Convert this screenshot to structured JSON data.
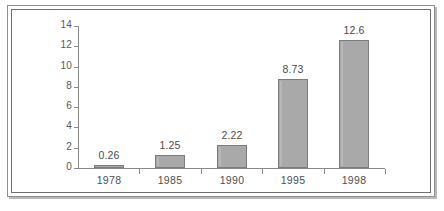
{
  "figure": {
    "border_color": "#8e8e8e",
    "background": "#ffffff"
  },
  "chart_data": {
    "type": "bar",
    "title": "",
    "subtitle": "",
    "xlabel": "",
    "ylabel": "",
    "categories": [
      "1978",
      "1985",
      "1990",
      "1995",
      "1998"
    ],
    "values": [
      0.26,
      1.25,
      2.22,
      8.73,
      12.6
    ],
    "value_labels": [
      "0.26",
      "1.25",
      "2.22",
      "8.73",
      "12.6"
    ],
    "ylim": [
      0,
      14
    ],
    "yticks": [
      0,
      2,
      4,
      6,
      8,
      10,
      12,
      14
    ],
    "ytick_labels": [
      "0",
      "2",
      "4",
      "6",
      "8",
      "10",
      "12",
      "14"
    ],
    "grid": false,
    "legend": null,
    "legend_position": "none",
    "series": [
      {
        "name": "",
        "values": [
          0.26,
          1.25,
          2.22,
          8.73,
          12.6
        ]
      }
    ],
    "bar_fill_color": "#a9a9a9",
    "bar_edge_color": "#7c7c7c",
    "axis_color": "#8a8a8a",
    "text_color": "#4f4f4f"
  }
}
